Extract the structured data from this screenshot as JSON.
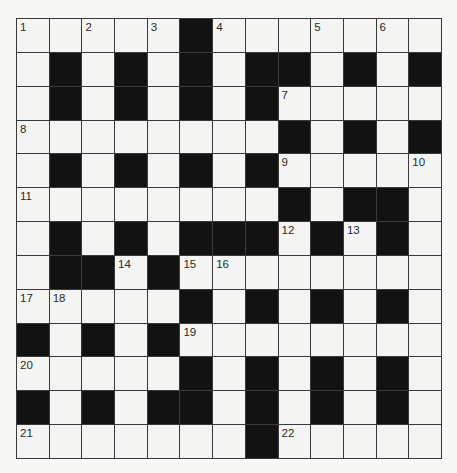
{
  "puzzle": {
    "rows": 13,
    "cols": 13,
    "colors": {
      "block": "#121212",
      "cell": "#f4f4f2",
      "grid_line": "#3a3a3a",
      "background": "#f7f7f5"
    },
    "grid": [
      "WWWWWBWWWWWWW",
      "WBWBWBWBBWBWB",
      "WBWBWBWBWWWWW",
      "WWWWWWWWBWBWB",
      "WBWBWBWBWWWWW",
      "WWWWWWWWBWBBW",
      "WBWBWBBBWBWBW",
      "WBBWBWWWWWWWW",
      "WWWWWBWBWBWBW",
      "BWBWBWWWWWWWW",
      "WWWWWBWBWBWBW",
      "BWBWBBWBWBWBW",
      "WWWWWWWBWWWWW"
    ],
    "numbers": [
      {
        "row": 0,
        "col": 0,
        "n": "1"
      },
      {
        "row": 0,
        "col": 2,
        "n": "2"
      },
      {
        "row": 0,
        "col": 4,
        "n": "3"
      },
      {
        "row": 0,
        "col": 6,
        "n": "4"
      },
      {
        "row": 0,
        "col": 9,
        "n": "5"
      },
      {
        "row": 0,
        "col": 11,
        "n": "6"
      },
      {
        "row": 2,
        "col": 8,
        "n": "7"
      },
      {
        "row": 3,
        "col": 0,
        "n": "8"
      },
      {
        "row": 4,
        "col": 8,
        "n": "9"
      },
      {
        "row": 4,
        "col": 12,
        "n": "10"
      },
      {
        "row": 5,
        "col": 0,
        "n": "11"
      },
      {
        "row": 6,
        "col": 8,
        "n": "12"
      },
      {
        "row": 6,
        "col": 10,
        "n": "13"
      },
      {
        "row": 7,
        "col": 3,
        "n": "14"
      },
      {
        "row": 7,
        "col": 5,
        "n": "15"
      },
      {
        "row": 7,
        "col": 6,
        "n": "16"
      },
      {
        "row": 8,
        "col": 0,
        "n": "17"
      },
      {
        "row": 8,
        "col": 1,
        "n": "18"
      },
      {
        "row": 9,
        "col": 5,
        "n": "19"
      },
      {
        "row": 10,
        "col": 0,
        "n": "20"
      },
      {
        "row": 12,
        "col": 0,
        "n": "21"
      },
      {
        "row": 12,
        "col": 8,
        "n": "22"
      }
    ]
  }
}
